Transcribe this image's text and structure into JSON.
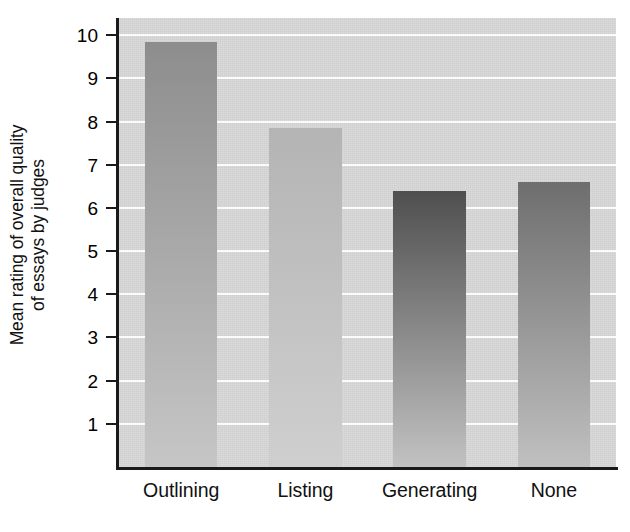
{
  "chart_data": {
    "type": "bar",
    "title": "",
    "subtitle": "",
    "xlabel": "",
    "ylabel_line1": "Mean rating of overall quality",
    "ylabel_line2": "of essays by judges",
    "categories": [
      "Outlining",
      "Listing",
      "Generating",
      "None"
    ],
    "values": [
      9.85,
      7.85,
      6.4,
      6.6
    ],
    "series": [
      {
        "name": "Mean rating of overall quality of essays by judges",
        "values": [
          9.85,
          7.85,
          6.4,
          6.6
        ]
      }
    ],
    "ylim": [
      0,
      10.4
    ],
    "xlim": [
      0,
      4
    ],
    "ytick_labels": [
      "1",
      "2",
      "3",
      "4",
      "5",
      "6",
      "7",
      "8",
      "9",
      "10"
    ],
    "ytick_values": [
      1,
      2,
      3,
      4,
      5,
      6,
      7,
      8,
      9,
      10
    ],
    "grid": true,
    "gridline_values": [
      1,
      2,
      3,
      4,
      5,
      6,
      7,
      8,
      9,
      10
    ],
    "gridline_color": "#fbfbfb",
    "legend": false,
    "legend_position": "none",
    "plot_background_color": "#d7d7d7",
    "axis_color": "#1a1a1a",
    "bar_colors_top": [
      "#8d8d8d",
      "#b4b4b4",
      "#4f4f4f",
      "#6e6e6e"
    ],
    "bar_colors_bottom": [
      "#c6c6c6",
      "#cfcfcf",
      "#c2c2c2",
      "#c0c0c0"
    ],
    "bars": [
      {
        "category": "Outlining",
        "value": 9.85,
        "color_top": "#8d8d8d",
        "color_bottom": "#c6c6c6"
      },
      {
        "category": "Listing",
        "value": 7.85,
        "color_top": "#b4b4b4",
        "color_bottom": "#cfcfcf"
      },
      {
        "category": "Generating",
        "value": 6.4,
        "color_top": "#4f4f4f",
        "color_bottom": "#c2c2c2"
      },
      {
        "category": "None",
        "value": 6.6,
        "color_top": "#6e6e6e",
        "color_bottom": "#c0c0c0"
      }
    ]
  }
}
